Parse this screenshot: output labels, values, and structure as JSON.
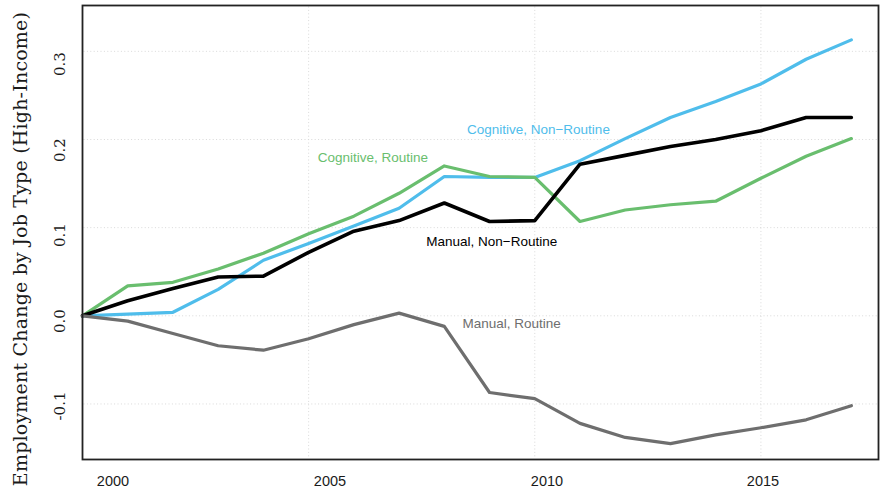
{
  "chart_data": {
    "type": "line",
    "title": "",
    "xlabel": "",
    "ylabel": "Employment Change by Job Type (High-Income)",
    "xlim": [
      2000,
      2017.6
    ],
    "ylim": [
      -0.163,
      0.352
    ],
    "xticks": [
      2000,
      2005,
      2010,
      2015
    ],
    "xticklabels": [
      "2000",
      "2005",
      "2010",
      "2015"
    ],
    "yticks": [
      -0.1,
      0.0,
      0.1,
      0.2,
      0.3
    ],
    "yticklabels": [
      "-0.1",
      "0.0",
      "0.1",
      "0.2",
      "0.3"
    ],
    "grid": true,
    "legend_position": "inline-annotations",
    "x": [
      2000,
      2001,
      2002,
      2003,
      2004,
      2005,
      2006,
      2007,
      2008,
      2009,
      2010,
      2011,
      2012,
      2013,
      2014,
      2015,
      2016,
      2017
    ],
    "series": [
      {
        "name": "Cognitive, Non-Routine",
        "label": "Cognitive, Non−Routine",
        "color": "#4FBDEB",
        "values": [
          0.0,
          0.002,
          0.004,
          0.03,
          0.063,
          0.082,
          0.102,
          0.122,
          0.158,
          0.157,
          0.157,
          0.176,
          0.201,
          0.225,
          0.243,
          0.263,
          0.291,
          0.313
        ],
        "label_x": 2008.5,
        "label_y": 0.21
      },
      {
        "name": "Cognitive, Routine",
        "label": "Cognitive, Routine",
        "color": "#69BE6E",
        "values": [
          0.0,
          0.034,
          0.038,
          0.053,
          0.071,
          0.093,
          0.113,
          0.139,
          0.17,
          0.158,
          0.157,
          0.107,
          0.12,
          0.126,
          0.13,
          0.156,
          0.181,
          0.201
        ],
        "label_x": 2005.2,
        "label_y": 0.178
      },
      {
        "name": "Manual, Non-Routine",
        "label": "Manual, Non−Routine",
        "color": "#000000",
        "values": [
          0.0,
          0.017,
          0.031,
          0.044,
          0.045,
          0.072,
          0.096,
          0.108,
          0.128,
          0.107,
          0.108,
          0.172,
          0.182,
          0.192,
          0.2,
          0.21,
          0.225,
          0.225
        ],
        "label_x": 2007.6,
        "label_y": 0.083
      },
      {
        "name": "Manual, Routine",
        "label": "Manual, Routine",
        "color": "#6E6E6E",
        "values": [
          0.0,
          -0.006,
          -0.02,
          -0.034,
          -0.039,
          -0.026,
          -0.01,
          0.003,
          -0.012,
          -0.087,
          -0.094,
          -0.122,
          -0.138,
          -0.145,
          -0.135,
          -0.127,
          -0.118,
          -0.102
        ],
        "label_x": 2008.4,
        "label_y": -0.01
      }
    ]
  },
  "axes": {
    "frame_color": "#222222",
    "grid_color": "#d9d9d9",
    "background": "#ffffff"
  }
}
